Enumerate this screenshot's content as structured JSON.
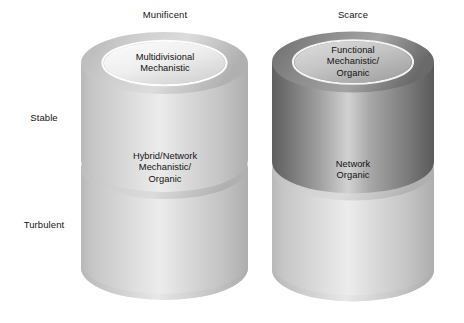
{
  "diagram": {
    "title_visible": false,
    "column_headers": [
      {
        "label": "Munificent",
        "name": "column-header-munificent"
      },
      {
        "label": "Scarce",
        "name": "column-header-scarce"
      }
    ],
    "row_headers": [
      {
        "label": "Stable",
        "name": "row-header-stable"
      },
      {
        "label": "Turbulent",
        "name": "row-header-turbulent"
      }
    ],
    "cells": [
      {
        "name": "cell-stable-munificent",
        "lines": [
          "Multidivisional",
          "Mechanistic"
        ],
        "column": "Munificent",
        "row": "Stable",
        "shade": "light"
      },
      {
        "name": "cell-stable-scarce",
        "lines": [
          "Functional",
          "Mechanistic/",
          "Organic"
        ],
        "column": "Scarce",
        "row": "Stable",
        "shade": "dark"
      },
      {
        "name": "cell-turbulent-munificent",
        "lines": [
          "Hybrid/Network",
          "Mechanistic/",
          "Organic"
        ],
        "column": "Munificent",
        "row": "Turbulent",
        "shade": "light"
      },
      {
        "name": "cell-turbulent-scarce",
        "lines": [
          "Network",
          "Organic"
        ],
        "column": "Scarce",
        "row": "Turbulent",
        "shade": "light"
      }
    ],
    "colors": {
      "background": "#ffffff",
      "text": "#111111",
      "cylinder_light_body_mid": "#d7d7d7",
      "cylinder_light_body_edge": "#b4b4b4",
      "cylinder_light_top_ring": "#c9c9c9",
      "cylinder_light_top_face": "#ededed",
      "cylinder_dark_body_mid": "#c9c9c9",
      "cylinder_dark_body_edge": "#6d6d6d",
      "cylinder_dark_top_ring": "#8a8a8a",
      "cylinder_dark_top_face": "#c2c2c2",
      "ring_highlight": "#fdfdfd"
    }
  }
}
